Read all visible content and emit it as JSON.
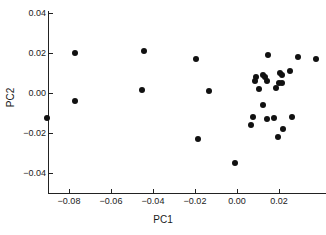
{
  "chart_data": {
    "type": "scatter",
    "title": "",
    "xlabel": "PC1",
    "ylabel": "PC2",
    "xlim": [
      -0.0929,
      0.0212
    ],
    "ylim": [
      -0.0495,
      0.044
    ],
    "grid": false,
    "legend": null,
    "xticks": [
      -0.08,
      -0.06,
      -0.04,
      -0.02,
      0.0,
      0.02
    ],
    "xticklabels": [
      "−0.08",
      "−0.06",
      "−0.04",
      "−0.02",
      "0.00",
      "0.02"
    ],
    "yticks": [
      0.04,
      0.02,
      0.0,
      -0.02,
      -0.04
    ],
    "yticklabels": [
      "0.04",
      "0.02",
      "0.00",
      "−0.02",
      "−0.04"
    ],
    "marker": "filled-circle",
    "marker_color": "#111111",
    "marker_size": 6,
    "n_points": 32,
    "points": [
      {
        "x": -0.0905,
        "y": -0.0125
      },
      {
        "x": -0.0771,
        "y": 0.0198
      },
      {
        "x": -0.0771,
        "y": -0.004
      },
      {
        "x": -0.0443,
        "y": 0.0212
      },
      {
        "x": -0.0452,
        "y": 0.0015
      },
      {
        "x": -0.0195,
        "y": 0.0172
      },
      {
        "x": -0.0131,
        "y": 0.001
      },
      {
        "x": -0.0186,
        "y": -0.0228
      },
      {
        "x": -0.001,
        "y": -0.0348
      },
      {
        "x": 0.0148,
        "y": 0.019
      },
      {
        "x": 0.029,
        "y": 0.0178
      },
      {
        "x": 0.0376,
        "y": 0.0172
      },
      {
        "x": 0.009,
        "y": 0.0082
      },
      {
        "x": 0.0124,
        "y": 0.009
      },
      {
        "x": 0.0131,
        "y": 0.0078
      },
      {
        "x": 0.0205,
        "y": 0.01
      },
      {
        "x": 0.0214,
        "y": 0.0092
      },
      {
        "x": 0.0252,
        "y": 0.0112
      },
      {
        "x": 0.0088,
        "y": 0.0062
      },
      {
        "x": 0.0145,
        "y": 0.0062
      },
      {
        "x": 0.02,
        "y": 0.005
      },
      {
        "x": 0.0212,
        "y": 0.0052
      },
      {
        "x": 0.0105,
        "y": 0.0022
      },
      {
        "x": 0.0188,
        "y": 0.0025
      },
      {
        "x": 0.0124,
        "y": -0.0058
      },
      {
        "x": 0.0074,
        "y": -0.0118
      },
      {
        "x": 0.0143,
        "y": -0.013
      },
      {
        "x": 0.0176,
        "y": -0.0125
      },
      {
        "x": 0.0262,
        "y": -0.0122
      },
      {
        "x": 0.0069,
        "y": -0.016
      },
      {
        "x": 0.0219,
        "y": -0.0182
      },
      {
        "x": 0.0195,
        "y": -0.0222
      }
    ]
  }
}
